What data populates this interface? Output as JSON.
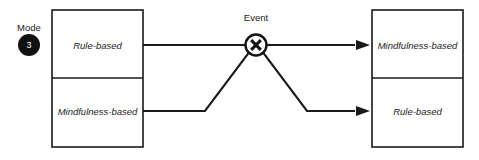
{
  "diagram": {
    "background_color": "#ffffff",
    "stroke_color": "#1a1a1a",
    "badge": {
      "label": "Mode",
      "number": "3",
      "fill_color": "#111111",
      "text_color": "#ffffff"
    },
    "event_node": {
      "label": "Event",
      "icon": "x-gate-icon",
      "shape": "circle-with-x"
    },
    "left_group": {
      "name": "before-event-states",
      "cells": [
        {
          "label": "Rule-based",
          "position": "top"
        },
        {
          "label": "Mindfulness-based",
          "position": "bottom"
        }
      ]
    },
    "right_group": {
      "name": "after-event-states",
      "cells": [
        {
          "label": "Mindfulness-based",
          "position": "top"
        },
        {
          "label": "Rule-based",
          "position": "bottom"
        }
      ]
    },
    "connections": [
      {
        "name": "rule-to-mindfulness",
        "from": "left-top-cell",
        "to": "right-top-cell",
        "via": "event-node",
        "arrowhead": true
      },
      {
        "name": "mindfulness-to-rule",
        "from": "left-bottom-cell",
        "to": "right-bottom-cell",
        "via": "event-node",
        "arrowhead": true
      }
    ]
  }
}
